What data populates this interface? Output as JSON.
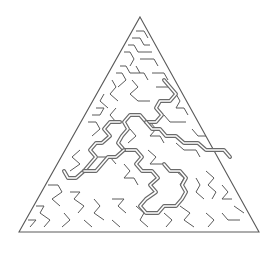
{
  "puzzle": {
    "type": "triangular-maze",
    "wall_color": "#5a5a5a",
    "solution_color": "#6a6a6a",
    "background": "#ffffff",
    "outline": [
      [
        140,
        17
      ],
      [
        259,
        232
      ],
      [
        19,
        232
      ]
    ],
    "walls": [
      [
        [
          136,
          31
        ],
        [
          144,
          31
        ],
        [
          148,
          38
        ]
      ],
      [
        [
          132,
          38
        ],
        [
          140,
          38
        ],
        [
          144,
          45
        ],
        [
          150,
          45
        ]
      ],
      [
        [
          128,
          45
        ],
        [
          134,
          45
        ],
        [
          138,
          52
        ],
        [
          152,
          52
        ]
      ],
      [
        [
          124,
          52
        ],
        [
          130,
          52
        ],
        [
          134,
          59
        ],
        [
          130,
          66
        ]
      ],
      [
        [
          140,
          59
        ],
        [
          154,
          59
        ],
        [
          158,
          66
        ]
      ],
      [
        [
          120,
          66
        ],
        [
          126,
          66
        ],
        [
          130,
          73
        ],
        [
          144,
          73
        ],
        [
          148,
          80
        ]
      ],
      [
        [
          136,
          66
        ],
        [
          140,
          73
        ]
      ],
      [
        [
          116,
          73
        ],
        [
          122,
          73
        ],
        [
          126,
          80
        ],
        [
          118,
          87
        ]
      ],
      [
        [
          152,
          73
        ],
        [
          164,
          73
        ],
        [
          168,
          80
        ]
      ],
      [
        [
          112,
          80
        ],
        [
          116,
          87
        ],
        [
          110,
          94
        ],
        [
          118,
          101
        ]
      ],
      [
        [
          132,
          80
        ],
        [
          138,
          87
        ],
        [
          130,
          94
        ],
        [
          138,
          101
        ],
        [
          150,
          101
        ]
      ],
      [
        [
          156,
          87
        ],
        [
          170,
          87
        ]
      ],
      [
        [
          104,
          94
        ],
        [
          100,
          101
        ],
        [
          108,
          108
        ]
      ],
      [
        [
          96,
          108
        ],
        [
          104,
          108
        ],
        [
          100,
          115
        ],
        [
          92,
          115
        ]
      ],
      [
        [
          116,
          108
        ],
        [
          110,
          115
        ],
        [
          116,
          122
        ]
      ],
      [
        [
          88,
          122
        ],
        [
          96,
          122
        ],
        [
          100,
          129
        ],
        [
          92,
          136
        ]
      ],
      [
        [
          176,
          94
        ],
        [
          180,
          101
        ],
        [
          176,
          108
        ],
        [
          184,
          108
        ],
        [
          188,
          115
        ]
      ],
      [
        [
          164,
          115
        ],
        [
          170,
          122
        ],
        [
          186,
          122
        ]
      ],
      [
        [
          150,
          122
        ],
        [
          156,
          129
        ],
        [
          150,
          136
        ],
        [
          160,
          136
        ],
        [
          164,
          143
        ]
      ],
      [
        [
          130,
          129
        ],
        [
          136,
          136
        ],
        [
          128,
          143
        ]
      ],
      [
        [
          192,
          129
        ],
        [
          198,
          136
        ],
        [
          206,
          136
        ]
      ],
      [
        [
          176,
          143
        ],
        [
          184,
          150
        ],
        [
          196,
          150
        ],
        [
          200,
          157
        ]
      ],
      [
        [
          148,
          150
        ],
        [
          156,
          157
        ],
        [
          150,
          164
        ],
        [
          162,
          164
        ]
      ],
      [
        [
          80,
          150
        ],
        [
          72,
          157
        ],
        [
          80,
          164
        ],
        [
          70,
          171
        ]
      ],
      [
        [
          98,
          157
        ],
        [
          110,
          157
        ],
        [
          116,
          164
        ]
      ],
      [
        [
          124,
          164
        ],
        [
          130,
          171
        ],
        [
          124,
          178
        ],
        [
          134,
          178
        ],
        [
          138,
          185
        ]
      ],
      [
        [
          176,
          171
        ],
        [
          184,
          178
        ],
        [
          180,
          185
        ],
        [
          188,
          192
        ]
      ],
      [
        [
          206,
          171
        ],
        [
          214,
          178
        ],
        [
          208,
          185
        ],
        [
          216,
          192
        ],
        [
          212,
          199
        ]
      ],
      [
        [
          196,
          178
        ],
        [
          200,
          185
        ],
        [
          196,
          192
        ],
        [
          204,
          199
        ]
      ],
      [
        [
          222,
          185
        ],
        [
          228,
          192
        ],
        [
          222,
          199
        ],
        [
          232,
          199
        ]
      ],
      [
        [
          48,
          185
        ],
        [
          58,
          185
        ],
        [
          62,
          192
        ],
        [
          52,
          199
        ],
        [
          60,
          206
        ]
      ],
      [
        [
          70,
          192
        ],
        [
          80,
          192
        ],
        [
          74,
          199
        ],
        [
          84,
          206
        ],
        [
          78,
          213
        ]
      ],
      [
        [
          94,
          199
        ],
        [
          100,
          206
        ],
        [
          94,
          213
        ],
        [
          104,
          220
        ]
      ],
      [
        [
          112,
          199
        ],
        [
          124,
          199
        ],
        [
          118,
          206
        ],
        [
          126,
          213
        ]
      ],
      [
        [
          36,
          206
        ],
        [
          44,
          206
        ],
        [
          40,
          213
        ],
        [
          50,
          220
        ],
        [
          44,
          227
        ]
      ],
      [
        [
          64,
          213
        ],
        [
          70,
          220
        ],
        [
          62,
          227
        ]
      ],
      [
        [
          84,
          220
        ],
        [
          92,
          227
        ]
      ],
      [
        [
          136,
          206
        ],
        [
          144,
          213
        ],
        [
          140,
          220
        ],
        [
          148,
          227
        ]
      ],
      [
        [
          180,
          206
        ],
        [
          190,
          213
        ],
        [
          184,
          220
        ],
        [
          194,
          227
        ]
      ],
      [
        [
          206,
          213
        ],
        [
          214,
          220
        ],
        [
          208,
          227
        ]
      ],
      [
        [
          222,
          213
        ],
        [
          228,
          220
        ],
        [
          240,
          220
        ]
      ],
      [
        [
          28,
          220
        ],
        [
          36,
          220
        ],
        [
          30,
          227
        ]
      ],
      [
        [
          112,
          220
        ],
        [
          120,
          227
        ]
      ],
      [
        [
          164,
          213
        ],
        [
          172,
          220
        ],
        [
          166,
          227
        ]
      ],
      [
        [
          234,
          206
        ],
        [
          244,
          213
        ]
      ]
    ],
    "solution_path": [
      [
        [
          164,
          80
        ],
        [
          170,
          87
        ],
        [
          176,
          94
        ],
        [
          170,
          101
        ],
        [
          160,
          101
        ],
        [
          156,
          108
        ],
        [
          162,
          115
        ],
        [
          156,
          122
        ],
        [
          146,
          122
        ],
        [
          140,
          115
        ],
        [
          130,
          115
        ],
        [
          124,
          122
        ],
        [
          128,
          129
        ],
        [
          122,
          136
        ],
        [
          118,
          143
        ],
        [
          124,
          150
        ],
        [
          136,
          150
        ],
        [
          142,
          157
        ],
        [
          136,
          164
        ],
        [
          142,
          171
        ],
        [
          152,
          171
        ],
        [
          158,
          178
        ],
        [
          150,
          185
        ],
        [
          156,
          192
        ],
        [
          146,
          199
        ],
        [
          140,
          206
        ],
        [
          146,
          213
        ],
        [
          158,
          213
        ],
        [
          164,
          206
        ],
        [
          176,
          206
        ],
        [
          182,
          199
        ],
        [
          186,
          192
        ],
        [
          182,
          185
        ],
        [
          186,
          178
        ],
        [
          180,
          171
        ],
        [
          170,
          171
        ],
        [
          164,
          164
        ]
      ],
      [
        [
          120,
          122
        ],
        [
          110,
          122
        ],
        [
          104,
          129
        ],
        [
          110,
          136
        ],
        [
          102,
          143
        ],
        [
          96,
          143
        ],
        [
          90,
          150
        ],
        [
          96,
          157
        ],
        [
          90,
          164
        ],
        [
          84,
          171
        ],
        [
          76,
          178
        ],
        [
          68,
          178
        ],
        [
          64,
          171
        ]
      ],
      [
        [
          124,
          150
        ],
        [
          116,
          157
        ],
        [
          108,
          157
        ],
        [
          102,
          164
        ],
        [
          96,
          171
        ],
        [
          84,
          171
        ]
      ],
      [
        [
          146,
          122
        ],
        [
          152,
          129
        ],
        [
          160,
          129
        ],
        [
          166,
          136
        ],
        [
          176,
          136
        ],
        [
          184,
          143
        ],
        [
          198,
          143
        ],
        [
          206,
          150
        ],
        [
          224,
          150
        ],
        [
          230,
          157
        ]
      ]
    ]
  }
}
